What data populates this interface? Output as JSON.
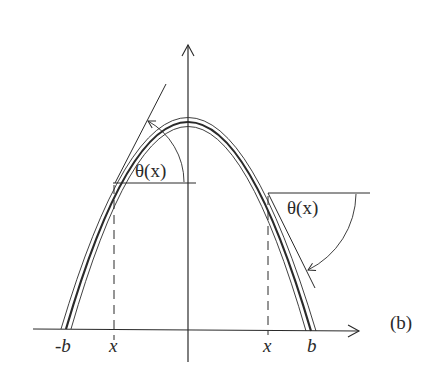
{
  "figure": {
    "panel_label": "(b)",
    "axes": {
      "x_axis": "horizontal axis with arrow",
      "y_axis": "vertical axis with arrow"
    },
    "tick_labels": {
      "neg_b": "-b",
      "left_x": "x",
      "right_x": "x",
      "b": "b"
    },
    "angle_labels": {
      "left": "θ(x)",
      "right": "θ(x)"
    },
    "curve": "parabolic arch drawn as a thick center line between two thin lines",
    "colors": {
      "ink": "#2a2a2a",
      "background": "#ffffff"
    }
  }
}
